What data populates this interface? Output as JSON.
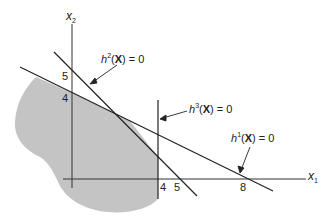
{
  "diagram": {
    "colors": {
      "region": "#c4c4c4",
      "line": "#222222",
      "axis": "#333333",
      "text": "#222222"
    },
    "axes": {
      "x1": {
        "label_var": "x",
        "label_sub": "1",
        "ticks": [
          "4",
          "5",
          "8"
        ]
      },
      "x2": {
        "label_var": "x",
        "label_sub": "2",
        "ticks": [
          "5",
          "4"
        ]
      }
    },
    "constraints": [
      {
        "id": "h1",
        "fn": "h",
        "sup": "1",
        "arg": "X",
        "rhs": "= 0",
        "intercepts": {
          "x1": 8,
          "x2": 4
        }
      },
      {
        "id": "h2",
        "fn": "h",
        "sup": "2",
        "arg": "X",
        "rhs": "= 0",
        "intercepts": {
          "x1": 5,
          "x2": 5
        }
      },
      {
        "id": "h3",
        "fn": "h",
        "sup": "3",
        "arg": "X",
        "rhs": "= 0",
        "x1_value": 4
      }
    ],
    "tick_labels": {
      "x2_5": "5",
      "x2_4": "4",
      "x1_4": "4",
      "x1_5": "5",
      "x1_8": "8"
    }
  }
}
